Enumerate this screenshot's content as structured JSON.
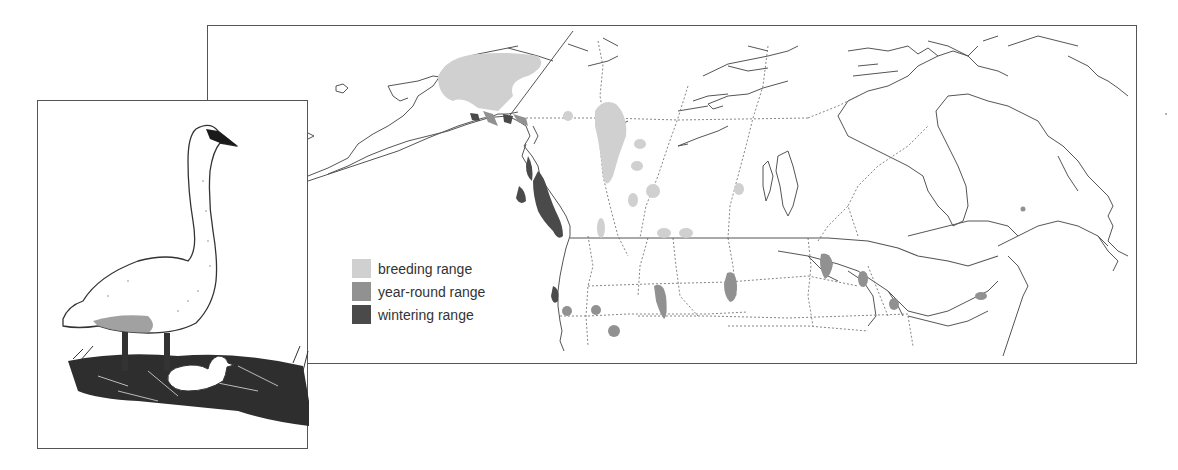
{
  "figure": {
    "illustration": {
      "adult": "adult swan standing",
      "cygnet": "cygnet on nest"
    }
  },
  "map": {
    "region": "North America (Alaska, Canada, northern United States)",
    "legend": [
      {
        "label": "breeding range",
        "color": "#d0d0d0"
      },
      {
        "label": "year-round range",
        "color": "#919191"
      },
      {
        "label": "wintering range",
        "color": "#4a4a4a"
      }
    ],
    "colors": {
      "border": "#555555",
      "coastline": "#555555",
      "political_boundary": "#777777"
    }
  }
}
